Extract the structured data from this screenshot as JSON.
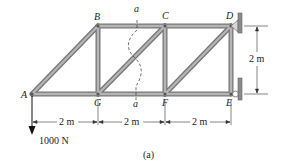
{
  "figure": {
    "caption": "(a)",
    "nodes": {
      "A": "A",
      "B": "B",
      "C": "C",
      "D": "D",
      "E": "E",
      "F": "F",
      "G": "G"
    },
    "section_label_top": "a",
    "section_label_bottom": "a",
    "dimensions": {
      "span_1": "2 m",
      "span_2": "2 m",
      "span_3": "2 m",
      "height": "2 m"
    },
    "load": "1000 N",
    "colors": {
      "member": "#9a9a9a",
      "member_edge": "#6e6e6e",
      "support": "#8a8a8a",
      "text": "#222222"
    }
  }
}
